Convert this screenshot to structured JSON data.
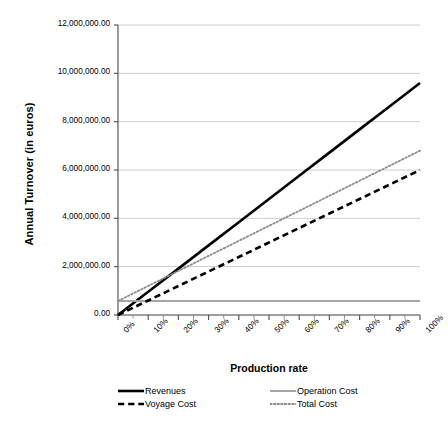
{
  "chart_data": {
    "type": "line",
    "title": "",
    "xlabel": "Production rate",
    "ylabel": "Annual Turnover (in euros)",
    "x": [
      0,
      10,
      20,
      30,
      40,
      50,
      60,
      70,
      80,
      90,
      100
    ],
    "categories": [
      "0%",
      "10%",
      "20%",
      "30%",
      "40%",
      "50%",
      "60%",
      "70%",
      "80%",
      "90%",
      "100%"
    ],
    "xlim": [
      0,
      100
    ],
    "ylim": [
      0,
      12000000
    ],
    "yticks": [
      0,
      2000000,
      4000000,
      6000000,
      8000000,
      10000000,
      12000000
    ],
    "ytick_labels": [
      "0.00",
      "2,000,000.00",
      "4,000,000.00",
      "6,000,000.00",
      "8,000,000.00",
      "10,000,000.00",
      "12,000,000.00"
    ],
    "grid": true,
    "grid_axis": "y",
    "grid_color": "#bfbfbf",
    "legend_position": "bottom",
    "series": [
      {
        "name": "Revenues",
        "style": "solid",
        "color": "#000000",
        "width": 2.6,
        "values": [
          0,
          960000,
          1920000,
          2880000,
          3840000,
          4800000,
          5760000,
          6720000,
          7680000,
          8640000,
          9600000
        ]
      },
      {
        "name": "Operation Cost",
        "style": "solid",
        "color": "#a6a6a6",
        "width": 2.0,
        "values": [
          580000,
          580000,
          580000,
          580000,
          580000,
          580000,
          580000,
          580000,
          580000,
          580000,
          580000
        ]
      },
      {
        "name": "Voyage Cost",
        "style": "dashed",
        "color": "#000000",
        "width": 2.6,
        "values": [
          0,
          600000,
          1200000,
          1800000,
          2400000,
          3000000,
          3600000,
          4200000,
          4800000,
          5400000,
          6000000
        ]
      },
      {
        "name": "Total Cost",
        "style": "dotted",
        "color": "#8c8c8c",
        "width": 1.8,
        "values": [
          580000,
          1202000,
          1824000,
          2446000,
          3068000,
          3690000,
          4312000,
          4934000,
          5556000,
          6178000,
          6800000
        ]
      }
    ]
  },
  "axis": {
    "y_title": "Annual Turnover (in euros)",
    "x_title": "Production rate"
  },
  "legend": {
    "items": [
      {
        "label": "Revenues",
        "swatch": "line-solid-black-icon"
      },
      {
        "label": "Operation Cost",
        "swatch": "line-solid-gray-icon"
      },
      {
        "label": "Voyage Cost",
        "swatch": "line-dashed-black-icon"
      },
      {
        "label": "Total Cost",
        "swatch": "line-dotted-gray-icon"
      }
    ]
  }
}
